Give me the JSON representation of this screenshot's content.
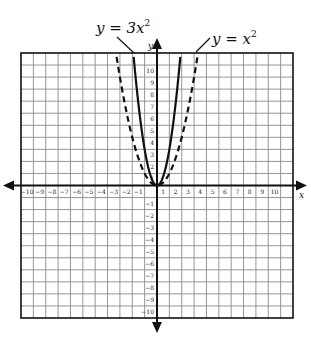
{
  "chart_data": {
    "type": "line",
    "title": "",
    "xlabel": "x",
    "ylabel": "y",
    "xlim": [
      -11,
      11
    ],
    "ylim": [
      -11,
      11
    ],
    "grid": true,
    "x_ticks": [
      -10,
      -9,
      -8,
      -7,
      -6,
      -5,
      -4,
      -3,
      -2,
      -1,
      1,
      2,
      3,
      4,
      5,
      6,
      7,
      8,
      9,
      10
    ],
    "y_ticks": [
      10,
      9,
      8,
      7,
      6,
      5,
      4,
      3,
      2,
      1,
      -1,
      -2,
      -3,
      -4,
      -5,
      -6,
      -7,
      -8,
      -9,
      -10
    ],
    "series": [
      {
        "name": "y = 3x²",
        "equation": "y = 3x^2",
        "style": "solid",
        "a": 3,
        "x": [
          -1.85,
          -1.5,
          -1,
          -0.5,
          0,
          0.5,
          1,
          1.5,
          1.85
        ],
        "y": [
          10.27,
          6.75,
          3,
          0.75,
          0,
          0.75,
          3,
          6.75,
          10.27
        ]
      },
      {
        "name": "y = x²",
        "equation": "y = x^2",
        "style": "dashed",
        "a": 1,
        "x": [
          -3.2,
          -3,
          -2,
          -1,
          0,
          1,
          2,
          3,
          3.2
        ],
        "y": [
          10.24,
          9,
          4,
          1,
          0,
          1,
          4,
          9,
          10.24
        ]
      }
    ],
    "annotations": [
      {
        "text_prefix": "y = 3x",
        "superscript": "2",
        "points_to": "y = 3x²"
      },
      {
        "text_prefix": "y = x",
        "superscript": "2",
        "points_to": "y = x²"
      }
    ],
    "legend": "inline labels with leader lines above graph"
  },
  "labels": {
    "axis_x": "x",
    "axis_y": "y",
    "curve1_prefix": "y = 3x",
    "curve1_sup": "2",
    "curve2_prefix": "y = x",
    "curve2_sup": "2"
  },
  "colors": {
    "grid": "#8a8a8a",
    "axis": "#111111",
    "curve": "#111111",
    "background": "#ffffff"
  }
}
